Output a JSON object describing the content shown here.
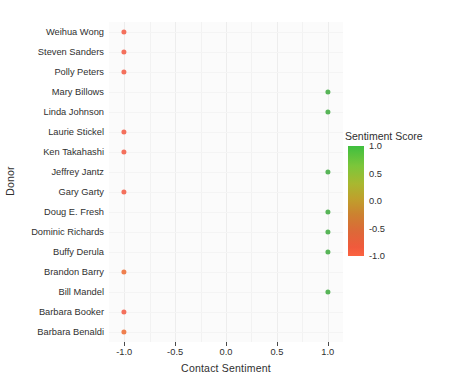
{
  "chart_data": {
    "type": "scatter",
    "title": "",
    "xlabel": "Contact Sentiment",
    "ylabel": "Donor",
    "xlim": [
      -1.15,
      1.15
    ],
    "x_ticks": [
      -1.0,
      -0.5,
      0.0,
      0.5,
      1.0
    ],
    "x_tick_labels": [
      "-1.0",
      "-0.5",
      "0.0",
      "0.5",
      "1.0"
    ],
    "grid": true,
    "legend": {
      "title": "Sentiment Score",
      "type": "continuous-colorbar",
      "position": "right",
      "ticks": [
        1.0,
        0.5,
        0.0,
        -0.5,
        -1.0
      ],
      "tick_labels": [
        "1.0",
        "0.5",
        "0.0",
        "-0.5",
        "-1.0"
      ],
      "color_high": "#3fbf3f",
      "color_mid": "#bfa02c",
      "color_low": "#fb6340"
    },
    "categories": [
      "Weihua Wong",
      "Steven Sanders",
      "Polly Peters",
      "Mary Billows",
      "Linda Johnson",
      "Laurie Stickel",
      "Ken Takahashi",
      "Jeffrey Jantz",
      "Gary Garty",
      "Doug E. Fresh",
      "Dominic Richards",
      "Buffy Derula",
      "Brandon Barry",
      "Bill Mandel",
      "Barbara Booker",
      "Barbara Benaldi"
    ],
    "points": [
      {
        "donor": "Weihua Wong",
        "x": -1.0,
        "sentiment": -1.0,
        "color": "#f4705c"
      },
      {
        "donor": "Steven Sanders",
        "x": -1.0,
        "sentiment": -1.0,
        "color": "#f4705c"
      },
      {
        "donor": "Polly Peters",
        "x": -1.0,
        "sentiment": -1.0,
        "color": "#f4705c"
      },
      {
        "donor": "Mary Billows",
        "x": 1.0,
        "sentiment": 1.0,
        "color": "#58b558"
      },
      {
        "donor": "Linda Johnson",
        "x": 1.0,
        "sentiment": 1.0,
        "color": "#58b558"
      },
      {
        "donor": "Laurie Stickel",
        "x": -1.0,
        "sentiment": -1.0,
        "color": "#f4705c"
      },
      {
        "donor": "Ken Takahashi",
        "x": -1.0,
        "sentiment": -1.0,
        "color": "#f4705c"
      },
      {
        "donor": "Jeffrey Jantz",
        "x": 1.0,
        "sentiment": 1.0,
        "color": "#58b558"
      },
      {
        "donor": "Gary Garty",
        "x": -1.0,
        "sentiment": -1.0,
        "color": "#f4705c"
      },
      {
        "donor": "Doug E. Fresh",
        "x": 1.0,
        "sentiment": 1.0,
        "color": "#58b558"
      },
      {
        "donor": "Dominic Richards",
        "x": 1.0,
        "sentiment": 1.0,
        "color": "#58b558"
      },
      {
        "donor": "Buffy Derula",
        "x": 1.0,
        "sentiment": 1.0,
        "color": "#58b558"
      },
      {
        "donor": "Brandon Barry",
        "x": -1.0,
        "sentiment": -1.0,
        "color": "#ef7f4e"
      },
      {
        "donor": "Bill Mandel",
        "x": 1.0,
        "sentiment": 1.0,
        "color": "#58b558"
      },
      {
        "donor": "Barbara Booker",
        "x": -1.0,
        "sentiment": -1.0,
        "color": "#f4705c"
      },
      {
        "donor": "Barbara Benaldi",
        "x": -1.0,
        "sentiment": -1.0,
        "color": "#ef7f4e"
      }
    ]
  }
}
